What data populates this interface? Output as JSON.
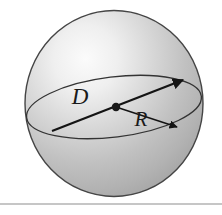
{
  "figure": {
    "kind": "sphere-diagram",
    "canvas": {
      "width": 222,
      "height": 215,
      "background": "#ffffff"
    },
    "sphere": {
      "name": "sphere-body",
      "center_x": 114,
      "center_y": 103.5,
      "radius_x": 89,
      "radius_y": 93,
      "fill": "#b9b9b9",
      "outline": "#454545",
      "outline_width": 1.4,
      "highlight": {
        "cx": 80,
        "cy": 52,
        "r": 86,
        "color": "#f2f2f2"
      },
      "shadow_color": "#9a9a9a"
    },
    "equator": {
      "name": "equator-ellipse",
      "center_x": 114,
      "center_y": 107,
      "radius_x": 88,
      "radius_y": 30,
      "rotation_deg": -7,
      "stroke": "#333333",
      "stroke_width": 1.3
    },
    "center_dot": {
      "name": "center-point",
      "x": 116,
      "y": 107,
      "radius": 4.2,
      "color": "#1a1a1a"
    },
    "diameter": {
      "name": "diameter-line",
      "label": "D",
      "label_x": 80,
      "label_y": 104,
      "x1": 52,
      "y1": 131,
      "x2": 183,
      "y2": 80,
      "stroke": "#141414",
      "stroke_width": 2.2,
      "arrowhead": "end"
    },
    "radius": {
      "name": "radius-arrow",
      "label": "R",
      "label_x": 141,
      "label_y": 126,
      "x1": 116,
      "y1": 107,
      "x2": 179,
      "y2": 128,
      "stroke": "#141414",
      "stroke_width": 1.5,
      "arrowhead": "end"
    },
    "baseline_rule": {
      "name": "bottom-divider",
      "y": 204,
      "x1": 0,
      "x2": 222,
      "stroke": "#8d8d8d",
      "stroke_width": 1
    }
  }
}
